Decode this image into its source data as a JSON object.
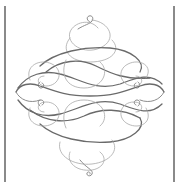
{
  "image": {
    "description": "Decorative calligraphic flourish ornament framed by two vertical rules",
    "colors": {
      "background": "#ffffff",
      "rule": "#8a8a8a",
      "stroke_dark": "#6a6a6a",
      "stroke_mid": "#8c8c8c",
      "stroke_light": "#a8a8a8"
    },
    "frame": {
      "left_rule": {
        "x": 4,
        "y_top": 6,
        "y_bottom": 182
      },
      "right_rule": {
        "x": 173,
        "y_top": 6,
        "y_bottom": 182
      }
    },
    "ornament": {
      "center": [
        89,
        95
      ],
      "shape": "diamond",
      "width": 150,
      "height": 160
    }
  }
}
